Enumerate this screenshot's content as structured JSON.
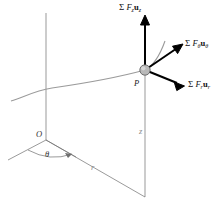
{
  "figure": {
    "background_color": "#ffffff",
    "width": 222,
    "height": 208
  },
  "colors": {
    "vector_stroke": "#000000",
    "axis_stroke": "#6f6f6f",
    "path_curve": "#9b9b9b",
    "particle_fill": "#b9b9b9",
    "particle_stroke": "#555555",
    "faint_text": "#8a8a8a",
    "text": "#111111"
  },
  "vectors": [
    {
      "id": "z-force",
      "label_sigma": "Σ",
      "label_F": "F",
      "label_F_sub": "z",
      "label_u": "u",
      "label_u_sub": "z",
      "label_plain": "Σ F₂u₂",
      "direction": "up",
      "from": [
        145,
        70
      ],
      "to": [
        145,
        18
      ]
    },
    {
      "id": "theta-force",
      "label_sigma": "Σ",
      "label_F": "F",
      "label_F_sub": "θ",
      "label_u": "u",
      "label_u_sub": "θ",
      "label_plain": "Σ Fθuθ",
      "direction": "upper-right",
      "from": [
        145,
        70
      ],
      "to": [
        182,
        45
      ]
    },
    {
      "id": "r-force",
      "label_sigma": "Σ",
      "label_F": "F",
      "label_F_sub": "r",
      "label_u": "u",
      "label_u_sub": "r",
      "label_plain": "Σ Fᵣuᵣ",
      "direction": "lower-right",
      "from": [
        145,
        70
      ],
      "to": [
        184,
        86
      ]
    }
  ],
  "annotations": {
    "origin": "O",
    "particle": "P",
    "radial_axis": "r",
    "vertical_axis": "z",
    "angle": "θ"
  }
}
